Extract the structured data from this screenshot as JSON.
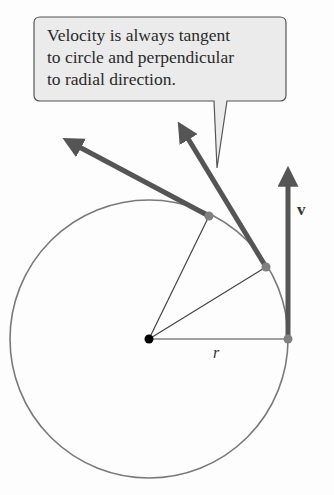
{
  "callout": {
    "lines": [
      "Velocity is always tangent",
      "to circle and perpendicular",
      "to radial direction."
    ],
    "fill": "#ebebeb",
    "stroke": "#555555"
  },
  "labels": {
    "velocity": "v",
    "radius": "r"
  },
  "colors": {
    "arrow": "#555555",
    "circle": "#777777",
    "radius_line": "#444444",
    "point": "#808080",
    "center": "#000000"
  }
}
